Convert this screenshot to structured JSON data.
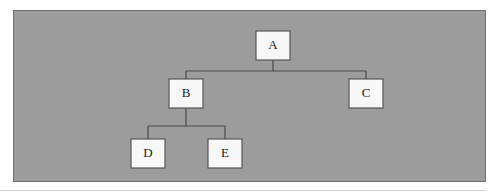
{
  "figure": {
    "kind": "tree-diagram",
    "panel": {
      "background_color": "#9c9c9c",
      "border_color": "#6f6f6f"
    },
    "node_style": {
      "fill_color": "#f7f7f7",
      "border_color": "#555555",
      "label_color": "#1a1a1a"
    },
    "connector_color": "#4a4a4a"
  },
  "nodes": [
    {
      "id": "A",
      "label": "A",
      "x": 242,
      "y": 20,
      "w": 34,
      "h": 29
    },
    {
      "id": "B",
      "label": "B",
      "x": 155,
      "y": 68,
      "w": 34,
      "h": 29
    },
    {
      "id": "C",
      "label": "C",
      "x": 335,
      "y": 68,
      "w": 34,
      "h": 29
    },
    {
      "id": "D",
      "label": "D",
      "x": 117,
      "y": 128,
      "w": 34,
      "h": 29
    },
    {
      "id": "E",
      "label": "E",
      "x": 194,
      "y": 128,
      "w": 34,
      "h": 29
    }
  ],
  "edges": [
    {
      "from": "A",
      "to": "B"
    },
    {
      "from": "A",
      "to": "C"
    },
    {
      "from": "B",
      "to": "D"
    },
    {
      "from": "B",
      "to": "E"
    }
  ],
  "connector_paths": [
    "M 259 49 L 259 60",
    "M 172 60 L 352 60",
    "M 172 60 L 172 68",
    "M 352 60 L 352 68",
    "M 172 97 L 172 115",
    "M 134 115 L 211 115",
    "M 134 115 L 134 128",
    "M 211 115 L 211 128"
  ]
}
